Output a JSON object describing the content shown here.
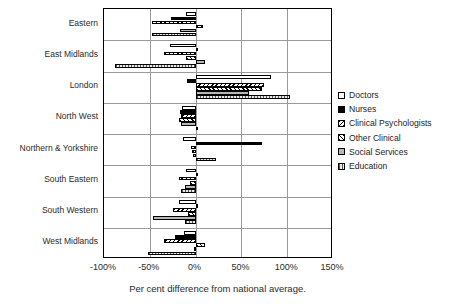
{
  "chart_data": {
    "type": "bar",
    "orientation": "horizontal",
    "title": "",
    "xlabel": "Per cent difference from national average.",
    "ylabel": "",
    "xlim": [
      -100,
      150
    ],
    "xticks": [
      "-100%",
      "-50%",
      "0%",
      "50%",
      "100%",
      "150%"
    ],
    "xtick_values": [
      -100,
      -50,
      0,
      50,
      100,
      150
    ],
    "grid": "vertical-and-horizontal",
    "legend_position": "right",
    "categories": [
      "Eastern",
      "East Midlands",
      "London",
      "North West",
      "Northern & Yorkshire",
      "South Eastern",
      "South Western",
      "West Midlands"
    ],
    "series": [
      {
        "name": "Doctors",
        "pattern": "white",
        "values": [
          -10,
          -28,
          82,
          -15,
          -14,
          -10,
          -18,
          -13
        ]
      },
      {
        "name": "Nurses",
        "pattern": "black",
        "values": [
          -27,
          2,
          -9,
          -17,
          73,
          1,
          2,
          -22
        ]
      },
      {
        "name": "Clinical Psychologists",
        "pattern": "backslash-hatch",
        "values": [
          -48,
          -35,
          75,
          -16,
          -5,
          -18,
          -25,
          -35
        ]
      },
      {
        "name": "Other Clinical",
        "pattern": "forward-hatch",
        "values": [
          8,
          -10,
          72,
          -18,
          -4,
          -6,
          -8,
          10
        ]
      },
      {
        "name": "Social Services",
        "pattern": "grey",
        "values": [
          -17,
          10,
          58,
          -16,
          -3,
          -12,
          -47,
          -2
        ]
      },
      {
        "name": "Education",
        "pattern": "vertical-lines",
        "values": [
          -48,
          -88,
          103,
          2,
          22,
          -16,
          -12,
          -52
        ]
      }
    ]
  },
  "legend": {
    "items": [
      {
        "label": "Doctors"
      },
      {
        "label": "Nurses"
      },
      {
        "label": "Clinical Psychologists"
      },
      {
        "label": "Other Clinical"
      },
      {
        "label": "Social Services"
      },
      {
        "label": "Education"
      }
    ]
  }
}
